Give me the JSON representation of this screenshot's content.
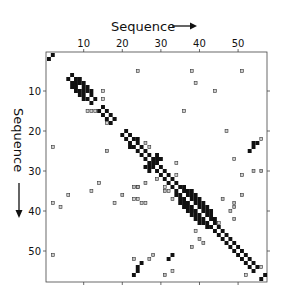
{
  "chart_data": {
    "type": "heatmap",
    "title": "",
    "xlabel": "Sequence",
    "ylabel": "Sequence",
    "x_ticks": [
      10,
      20,
      30,
      40,
      50
    ],
    "y_ticks": [
      10,
      20,
      30,
      40,
      50
    ],
    "range": [
      1,
      57
    ],
    "grid": false,
    "legend": "none",
    "cell_types": {
      "solid": "strong match",
      "dotted": "weak match (stippled box)",
      "hatched": "medium match (hatched)"
    },
    "colors": {
      "solid": "#111111",
      "box_stroke": "#333333",
      "box_fill": "#cfcfcf"
    },
    "cells": {
      "solid": [
        [
          1,
          2
        ],
        [
          2,
          1
        ],
        [
          6,
          7
        ],
        [
          7,
          6
        ],
        [
          7,
          8
        ],
        [
          8,
          7
        ],
        [
          8,
          9
        ],
        [
          9,
          8
        ],
        [
          9,
          10
        ],
        [
          10,
          9
        ],
        [
          10,
          11
        ],
        [
          11,
          10
        ],
        [
          11,
          12
        ],
        [
          12,
          11
        ],
        [
          12,
          13
        ],
        [
          13,
          12
        ],
        [
          8,
          8
        ],
        [
          10,
          10
        ],
        [
          7,
          9
        ],
        [
          9,
          7
        ],
        [
          9,
          11
        ],
        [
          11,
          9
        ],
        [
          10,
          12
        ],
        [
          12,
          10
        ],
        [
          8,
          10
        ],
        [
          10,
          8
        ],
        [
          14,
          15
        ],
        [
          15,
          14
        ],
        [
          15,
          16
        ],
        [
          16,
          15
        ],
        [
          16,
          17
        ],
        [
          17,
          16
        ],
        [
          17,
          18
        ],
        [
          18,
          17
        ],
        [
          20,
          21
        ],
        [
          21,
          20
        ],
        [
          21,
          22
        ],
        [
          22,
          21
        ],
        [
          22,
          23
        ],
        [
          23,
          22
        ],
        [
          23,
          24
        ],
        [
          24,
          23
        ],
        [
          24,
          25
        ],
        [
          25,
          24
        ],
        [
          25,
          26
        ],
        [
          26,
          25
        ],
        [
          26,
          27
        ],
        [
          27,
          26
        ],
        [
          22,
          24
        ],
        [
          24,
          22
        ],
        [
          27,
          28
        ],
        [
          28,
          27
        ],
        [
          28,
          29
        ],
        [
          29,
          28
        ],
        [
          27,
          29
        ],
        [
          29,
          27
        ],
        [
          28,
          28
        ],
        [
          29,
          30
        ],
        [
          30,
          29
        ],
        [
          26,
          29
        ],
        [
          29,
          26
        ],
        [
          30,
          31
        ],
        [
          31,
          30
        ],
        [
          31,
          32
        ],
        [
          32,
          31
        ],
        [
          32,
          33
        ],
        [
          33,
          32
        ],
        [
          30,
          27
        ],
        [
          27,
          30
        ],
        [
          33,
          34
        ],
        [
          34,
          33
        ],
        [
          34,
          35
        ],
        [
          35,
          34
        ],
        [
          35,
          36
        ],
        [
          36,
          35
        ],
        [
          36,
          37
        ],
        [
          37,
          36
        ],
        [
          37,
          38
        ],
        [
          38,
          37
        ],
        [
          38,
          39
        ],
        [
          39,
          38
        ],
        [
          39,
          40
        ],
        [
          40,
          39
        ],
        [
          40,
          41
        ],
        [
          41,
          40
        ],
        [
          41,
          42
        ],
        [
          42,
          41
        ],
        [
          42,
          43
        ],
        [
          43,
          42
        ],
        [
          43,
          44
        ],
        [
          44,
          43
        ],
        [
          44,
          45
        ],
        [
          45,
          44
        ],
        [
          45,
          46
        ],
        [
          46,
          45
        ],
        [
          46,
          47
        ],
        [
          47,
          46
        ],
        [
          47,
          48
        ],
        [
          48,
          47
        ],
        [
          48,
          49
        ],
        [
          49,
          48
        ],
        [
          49,
          50
        ],
        [
          50,
          49
        ],
        [
          50,
          51
        ],
        [
          51,
          50
        ],
        [
          51,
          52
        ],
        [
          52,
          51
        ],
        [
          52,
          53
        ],
        [
          53,
          52
        ],
        [
          53,
          54
        ],
        [
          54,
          53
        ],
        [
          54,
          55
        ],
        [
          55,
          54
        ],
        [
          34,
          36
        ],
        [
          36,
          34
        ],
        [
          35,
          37
        ],
        [
          37,
          35
        ],
        [
          36,
          38
        ],
        [
          38,
          36
        ],
        [
          37,
          39
        ],
        [
          39,
          37
        ],
        [
          38,
          40
        ],
        [
          40,
          38
        ],
        [
          39,
          41
        ],
        [
          41,
          39
        ],
        [
          40,
          42
        ],
        [
          42,
          40
        ],
        [
          41,
          43
        ],
        [
          43,
          41
        ],
        [
          42,
          44
        ],
        [
          44,
          42
        ],
        [
          35,
          38
        ],
        [
          38,
          35
        ],
        [
          36,
          39
        ],
        [
          39,
          36
        ],
        [
          37,
          40
        ],
        [
          40,
          37
        ],
        [
          38,
          41
        ],
        [
          41,
          38
        ],
        [
          39,
          42
        ],
        [
          42,
          39
        ],
        [
          40,
          43
        ],
        [
          43,
          40
        ],
        [
          25,
          53
        ],
        [
          24,
          54
        ],
        [
          24,
          55
        ],
        [
          23,
          56
        ],
        [
          53,
          25
        ],
        [
          54,
          24
        ],
        [
          54,
          23
        ],
        [
          55,
          23
        ],
        [
          56,
          57
        ],
        [
          57,
          56
        ],
        [
          32,
          52
        ],
        [
          33,
          51
        ]
      ],
      "dotted": [
        [
          2,
          24
        ],
        [
          2,
          38
        ],
        [
          2,
          51
        ],
        [
          4,
          39
        ],
        [
          6,
          36
        ],
        [
          12,
          15
        ],
        [
          15,
          10
        ],
        [
          15,
          12
        ],
        [
          16,
          18
        ],
        [
          24,
          5
        ],
        [
          13,
          15
        ],
        [
          11,
          15
        ],
        [
          31,
          34
        ],
        [
          32,
          35
        ],
        [
          34,
          31
        ],
        [
          36,
          15
        ],
        [
          38,
          5
        ],
        [
          38,
          40
        ],
        [
          39,
          8
        ],
        [
          39,
          45
        ],
        [
          44,
          10
        ],
        [
          45,
          43
        ],
        [
          47,
          20
        ],
        [
          49,
          27
        ],
        [
          51,
          5
        ],
        [
          51,
          31
        ],
        [
          56,
          22
        ],
        [
          56,
          54
        ],
        [
          52,
          56
        ],
        [
          33,
          55
        ],
        [
          34,
          28
        ],
        [
          25,
          38
        ],
        [
          23,
          37
        ],
        [
          24,
          37
        ],
        [
          26,
          38
        ],
        [
          18,
          38
        ],
        [
          14,
          33
        ],
        [
          12,
          35
        ]
      ],
      "hatched": [
        [
          16,
          25
        ],
        [
          20,
          36
        ],
        [
          23,
          34
        ],
        [
          24,
          34
        ],
        [
          26,
          33
        ],
        [
          24,
          34
        ],
        [
          31,
          35
        ],
        [
          18,
          17
        ],
        [
          27,
          52
        ],
        [
          28,
          51
        ],
        [
          23,
          52
        ],
        [
          31,
          56
        ],
        [
          33,
          37
        ],
        [
          38,
          49
        ],
        [
          40,
          47
        ],
        [
          41,
          48
        ],
        [
          46,
          37
        ],
        [
          48,
          40
        ],
        [
          49,
          38
        ],
        [
          49,
          39
        ],
        [
          51,
          36
        ],
        [
          54,
          30
        ],
        [
          56,
          30
        ],
        [
          29,
          32
        ],
        [
          27,
          24
        ],
        [
          26,
          23
        ],
        [
          49,
          42
        ]
      ]
    }
  },
  "axis": {
    "x_label": "Sequence",
    "y_label": "Sequence",
    "x_arrow": "→",
    "y_arrow": "↓"
  }
}
